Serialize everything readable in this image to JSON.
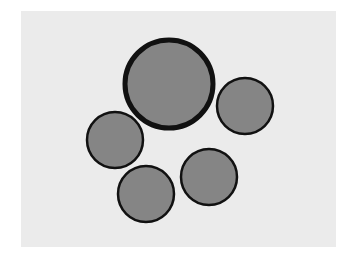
{
  "figure": {
    "background_color": "#ffffff",
    "panel_color": "#ebebeb",
    "circle_fill": "#858585",
    "stroke_color": "#111111",
    "circles": [
      {
        "name": "large-circle-top",
        "cx": 169,
        "cy": 84,
        "r": 44,
        "stroke_width": 5
      },
      {
        "name": "circle-right",
        "cx": 245,
        "cy": 106,
        "r": 28,
        "stroke_width": 2.5
      },
      {
        "name": "circle-left",
        "cx": 115,
        "cy": 140,
        "r": 28,
        "stroke_width": 2.5
      },
      {
        "name": "circle-bottom-left",
        "cx": 146,
        "cy": 194,
        "r": 28,
        "stroke_width": 2.5
      },
      {
        "name": "circle-bottom-right",
        "cx": 209,
        "cy": 177,
        "r": 28,
        "stroke_width": 2.5
      }
    ]
  }
}
